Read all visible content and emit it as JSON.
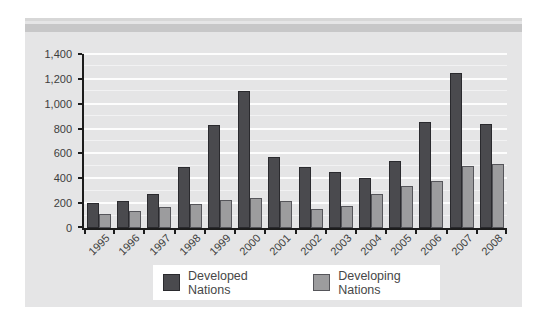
{
  "figure": {
    "background": "#ffffff",
    "panel_bg": "#e5e5e6",
    "top_rule_color": "#d7d7d7",
    "top_band_color": "#c7c7c8",
    "axis_color": "#1c1c1c",
    "gridline_color": "#fdfdfd",
    "label_color": "#3d3d3d",
    "legend_bg": "#ffffff"
  },
  "chart_data": {
    "type": "bar",
    "categories": [
      "1995",
      "1996",
      "1997",
      "1998",
      "1999",
      "2000",
      "2001",
      "2002",
      "2003",
      "2004",
      "2005",
      "2006",
      "2007",
      "2008"
    ],
    "series": [
      {
        "name": "Developed Nations",
        "color": "#4a4a4e",
        "border_color": "#2a2a2e",
        "values": [
          200,
          215,
          270,
          490,
          825,
          1100,
          570,
          490,
          450,
          400,
          540,
          855,
          1245,
          835
        ]
      },
      {
        "name": "Developing Nations",
        "color": "#9c9c9e",
        "border_color": "#55555a",
        "values": [
          110,
          140,
          170,
          190,
          225,
          245,
          215,
          155,
          175,
          270,
          335,
          380,
          500,
          515
        ]
      }
    ],
    "ylim": [
      0,
      1400
    ],
    "ytick_step": 200,
    "ytick_labels": [
      "0",
      "200",
      "400",
      "600",
      "800",
      "1,000",
      "1,200",
      "1,400"
    ],
    "minor_grid_step": 100,
    "grid": true,
    "legend_position": "bottom-center"
  }
}
